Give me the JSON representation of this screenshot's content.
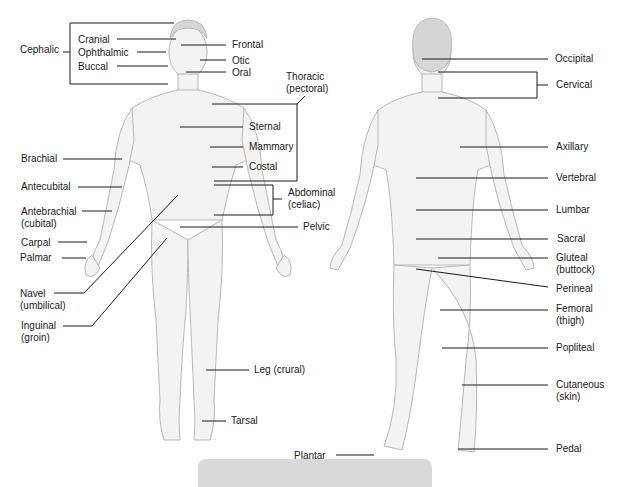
{
  "colors": {
    "line": "#1a1a1a",
    "skin": "#f2f2f2",
    "skin_stroke": "#bdbdbd",
    "hair": "#cfcfcf",
    "bottom_bar": "#d9d9d9"
  },
  "anterior": {
    "labels": [
      {
        "id": "cephalic",
        "text": "Cephalic",
        "x": 20,
        "y": 44
      },
      {
        "id": "cranial",
        "text": "Cranial",
        "x": 78,
        "y": 34
      },
      {
        "id": "ophthalmic",
        "text": "Ophthalmic",
        "x": 78,
        "y": 47
      },
      {
        "id": "buccal",
        "text": "Buccal",
        "x": 78,
        "y": 62
      },
      {
        "id": "frontal",
        "text": "Frontal",
        "x": 232,
        "y": 39
      },
      {
        "id": "otic",
        "text": "Otic",
        "x": 232,
        "y": 55
      },
      {
        "id": "oral",
        "text": "Oral",
        "x": 232,
        "y": 68
      },
      {
        "id": "thoracic",
        "text": "Thoracic",
        "sub": "(pectoral)",
        "x": 286,
        "y": 71
      },
      {
        "id": "sternal",
        "text": "Sternal",
        "x": 249,
        "y": 122
      },
      {
        "id": "mammary",
        "text": "Mammary",
        "x": 249,
        "y": 142
      },
      {
        "id": "costal",
        "text": "Costal",
        "x": 249,
        "y": 162
      },
      {
        "id": "abdominal",
        "text": "Abdominal",
        "sub": "(celiac)",
        "x": 288,
        "y": 187
      },
      {
        "id": "pelvic",
        "text": "Pelvic",
        "x": 303,
        "y": 223
      },
      {
        "id": "brachial",
        "text": "Brachial",
        "x": 21,
        "y": 154
      },
      {
        "id": "antecubital",
        "text": "Antecubital",
        "x": 21,
        "y": 181
      },
      {
        "id": "antebrachial",
        "text": "Antebrachial",
        "sub": "(cubital)",
        "x": 21,
        "y": 206
      },
      {
        "id": "carpal",
        "text": "Carpal",
        "x": 21,
        "y": 237
      },
      {
        "id": "palmar",
        "text": "Palmar",
        "x": 20,
        "y": 253
      },
      {
        "id": "navel",
        "text": "Navel",
        "sub": "(umbilical)",
        "x": 20,
        "y": 288
      },
      {
        "id": "inguinal",
        "text": "Inguinal",
        "sub": "(groin)",
        "x": 21,
        "y": 320
      },
      {
        "id": "leg",
        "text": "Leg (crural)",
        "x": 254,
        "y": 365
      },
      {
        "id": "tarsal",
        "text": "Tarsal",
        "x": 231,
        "y": 416
      }
    ]
  },
  "posterior": {
    "labels": [
      {
        "id": "occipital",
        "text": "Occipital",
        "x": 555,
        "y": 54
      },
      {
        "id": "cervical",
        "text": "Cervical",
        "x": 556,
        "y": 80
      },
      {
        "id": "axillary",
        "text": "Axillary",
        "x": 556,
        "y": 142
      },
      {
        "id": "vertebral",
        "text": "Vertebral",
        "x": 556,
        "y": 173
      },
      {
        "id": "lumbar",
        "text": "Lumbar",
        "x": 556,
        "y": 205
      },
      {
        "id": "sacral",
        "text": "Sacral",
        "x": 557,
        "y": 234
      },
      {
        "id": "gluteal",
        "text": "Gluteal",
        "sub": "(buttock)",
        "x": 556,
        "y": 253
      },
      {
        "id": "perineal",
        "text": "Perineal",
        "x": 556,
        "y": 284
      },
      {
        "id": "femoral",
        "text": "Femoral",
        "sub": "(thigh)",
        "x": 556,
        "y": 303
      },
      {
        "id": "popliteal",
        "text": "Popliteal",
        "x": 556,
        "y": 342
      },
      {
        "id": "cutaneous",
        "text": "Cutaneous",
        "sub": "(skin)",
        "x": 556,
        "y": 379
      },
      {
        "id": "plantar",
        "text": "Plantar",
        "x": 294,
        "y": 451
      },
      {
        "id": "pedal",
        "text": "Pedal",
        "x": 556,
        "y": 444
      }
    ]
  }
}
